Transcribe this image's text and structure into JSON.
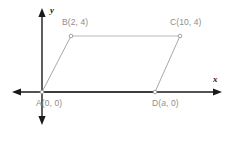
{
  "figure": {
    "type": "coordinate-geometry-diagram",
    "shape": "parallelogram",
    "width": 243,
    "height": 142,
    "background_color": "#ffffff"
  },
  "axes": {
    "x_label": "x",
    "y_label": "y",
    "axis_color": "#1a1a1a",
    "origin_px": {
      "x": 42,
      "y": 92
    },
    "x_axis_px": {
      "x1": 12,
      "x2": 222,
      "y": 92
    },
    "y_axis_px": {
      "x": 42,
      "y1": 9,
      "y2": 124
    },
    "arrowheads": [
      "left",
      "right",
      "up",
      "down"
    ]
  },
  "labels": {
    "A": "A(0, 0)",
    "B": "B(2, 4)",
    "C": "C(10, 4)",
    "D_prefix": "D(",
    "D_var": "a",
    "D_suffix": ", 0)",
    "text_color": "#8d8d8d"
  },
  "vertices": [
    {
      "name": "A",
      "label": "A(0, 0)",
      "coords": [
        0,
        0
      ],
      "px": {
        "x": 42,
        "y": 92
      }
    },
    {
      "name": "B",
      "label": "B(2, 4)",
      "coords": [
        2,
        4
      ],
      "px": {
        "x": 71,
        "y": 36
      }
    },
    {
      "name": "C",
      "label": "C(10, 4)",
      "coords": [
        10,
        4
      ],
      "px": {
        "x": 180,
        "y": 36
      }
    },
    {
      "name": "D",
      "label": "D(a, 0)",
      "coords": [
        "a",
        0
      ],
      "px": {
        "x": 155,
        "y": 92
      }
    }
  ],
  "edges": [
    {
      "name": "AB",
      "from": "A",
      "to": "B",
      "color": "#a8a8a8"
    },
    {
      "name": "BC",
      "from": "B",
      "to": "C",
      "color": "#b8b8b8"
    },
    {
      "name": "CD",
      "from": "C",
      "to": "D",
      "color": "#a8a8a8"
    },
    {
      "name": "DA",
      "from": "D",
      "to": "A",
      "color": "#8a8a8a"
    }
  ],
  "vertex_marker": {
    "radius": 1.8,
    "fill": "#ffffff",
    "stroke": "#9a9a9a"
  }
}
